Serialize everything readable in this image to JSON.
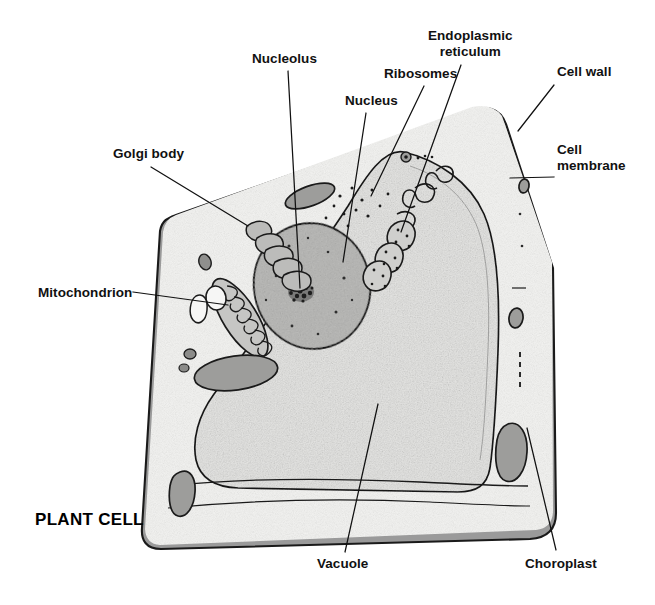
{
  "figure": {
    "title": "PLANT CELL",
    "title_position": {
      "x": 35,
      "y": 510
    }
  },
  "palette": {
    "background": "#ffffff",
    "ink": "#1a1a1a",
    "cell_wall": "#9a9a9a",
    "cell_wall_dark": "#8d8d8d",
    "cytoplasm": "#f2f2f0",
    "vacuole": "#e2e2e0",
    "nucleus": "#b9b9b7",
    "nucleolus": "#3a3a3a",
    "organelle_gray": "#a9a9a7",
    "chloroplast": "#9d9d9b",
    "leader_line": "#111111"
  },
  "labels": [
    {
      "id": "nucleolus",
      "text": "Nucleolus",
      "align": "center",
      "position": {
        "x": 252,
        "y": 51
      },
      "leader": {
        "x1": 288,
        "y1": 71,
        "x2": 300,
        "y2": 288
      }
    },
    {
      "id": "nucleus",
      "text": "Nucleus",
      "align": "center",
      "position": {
        "x": 345,
        "y": 93
      },
      "leader": {
        "x1": 366,
        "y1": 113,
        "x2": 343,
        "y2": 262
      }
    },
    {
      "id": "ribosomes",
      "text": "Ribosomes",
      "align": "center",
      "position": {
        "x": 384,
        "y": 66
      },
      "leader": {
        "x1": 424,
        "y1": 86,
        "x2": 371,
        "y2": 196
      }
    },
    {
      "id": "endoplasmic-reticulum",
      "text": "Endoplasmic\nreticulum",
      "align": "center",
      "position": {
        "x": 428,
        "y": 28
      },
      "leader": {
        "x1": 461,
        "y1": 65,
        "x2": 401,
        "y2": 232
      }
    },
    {
      "id": "cell-wall",
      "text": "Cell wall",
      "align": "left",
      "position": {
        "x": 557,
        "y": 64
      },
      "leader": {
        "x1": 554,
        "y1": 85,
        "x2": 518,
        "y2": 131
      }
    },
    {
      "id": "cell-membrane",
      "text": "Cell\nmembrane",
      "align": "left",
      "position": {
        "x": 557,
        "y": 142
      },
      "leader": {
        "x1": 554,
        "y1": 177,
        "x2": 510,
        "y2": 178
      }
    },
    {
      "id": "golgi-body",
      "text": "Golgi body",
      "align": "left",
      "position": {
        "x": 113,
        "y": 146
      },
      "leader": {
        "x1": 151,
        "y1": 167,
        "x2": 248,
        "y2": 226
      }
    },
    {
      "id": "mitochondrion",
      "text": "Mitochondrion",
      "align": "left",
      "position": {
        "x": 38,
        "y": 285
      },
      "leader": {
        "x1": 133,
        "y1": 292,
        "x2": 228,
        "y2": 305
      }
    },
    {
      "id": "vacuole",
      "text": "Vacuole",
      "align": "center",
      "position": {
        "x": 317,
        "y": 556
      },
      "leader": {
        "x1": 345,
        "y1": 552,
        "x2": 378,
        "y2": 404
      }
    },
    {
      "id": "choroplast",
      "text": "Choroplast",
      "align": "center",
      "position": {
        "x": 525,
        "y": 556
      },
      "leader": {
        "x1": 556,
        "y1": 550,
        "x2": 527,
        "y2": 428
      }
    }
  ],
  "structures": [
    {
      "id": "cell-wall-band",
      "name": "cell wall"
    },
    {
      "id": "cell-membrane-line",
      "name": "cell membrane"
    },
    {
      "id": "cytoplasm-area",
      "name": "cytoplasm"
    },
    {
      "id": "vacuole-area",
      "name": "vacuole"
    },
    {
      "id": "nucleus-body",
      "name": "nucleus"
    },
    {
      "id": "nucleolus-body",
      "name": "nucleolus"
    },
    {
      "id": "golgi-body-stack",
      "name": "golgi body"
    },
    {
      "id": "mitochondrion-body",
      "name": "mitochondrion"
    },
    {
      "id": "endoplasmic-reticulum-body",
      "name": "endoplasmic reticulum"
    },
    {
      "id": "ribosome-dots",
      "name": "ribosomes"
    },
    {
      "id": "chloroplast-bodies",
      "name": "chloroplasts"
    }
  ]
}
